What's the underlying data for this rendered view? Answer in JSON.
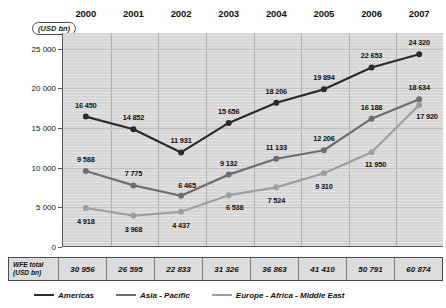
{
  "unit_badge": "(USD bn)",
  "totals_header_line1": "WFE total",
  "totals_header_line2": "(USD bn)",
  "colors": {
    "americas": "#2b2b2b",
    "asia_pacific": "#6e6e6e",
    "europe_africa_middle_east": "#9e9e9e",
    "plot_background": "#d6d6d6",
    "axis": "#5a5a5a",
    "gridline": "#b0b0b0"
  },
  "chart_data": {
    "type": "line",
    "title": "",
    "xlabel": "",
    "ylabel": "(USD bn)",
    "ylim": [
      0,
      27000
    ],
    "grid": true,
    "legend_position": "bottom",
    "categories": [
      "2000",
      "2001",
      "2002",
      "2003",
      "2004",
      "2005",
      "2006",
      "2007"
    ],
    "yticks": [
      "0",
      "5 000",
      "10 000",
      "15 000",
      "20 000",
      "25 000"
    ],
    "ytick_values": [
      0,
      5000,
      10000,
      15000,
      20000,
      25000
    ],
    "series": [
      {
        "name": "Americas",
        "color": "#2b2b2b",
        "values": [
          16450,
          14852,
          11931,
          15656,
          18206,
          19894,
          22653,
          24320
        ],
        "labels": [
          "16 450",
          "14 852",
          "11 931",
          "15 656",
          "18 206",
          "19 894",
          "22 653",
          "24 320"
        ]
      },
      {
        "name": "Asia - Pacific",
        "color": "#6e6e6e",
        "values": [
          9588,
          7775,
          6465,
          9132,
          11133,
          12206,
          16188,
          18634
        ],
        "labels": [
          "9 588",
          "7 775",
          "6 465",
          "9 132",
          "11 133",
          "12 206",
          "16 188",
          "18 634"
        ]
      },
      {
        "name": "Europe - Africa - Middle East",
        "color": "#9e9e9e",
        "values": [
          4918,
          3968,
          4437,
          6538,
          7524,
          9310,
          11950,
          17920
        ],
        "labels": [
          "4 918",
          "3 968",
          "4 437",
          "6 538",
          "7 524",
          "9 310",
          "11 950",
          "17 920"
        ]
      }
    ],
    "totals_row": {
      "label": "WFE total (USD bn)",
      "values": [
        30956,
        26595,
        22833,
        31326,
        36863,
        41410,
        50791,
        60874
      ],
      "labels": [
        "30 956",
        "26 595",
        "22 833",
        "31 326",
        "36 863",
        "41 410",
        "50 791",
        "60 874"
      ]
    }
  }
}
